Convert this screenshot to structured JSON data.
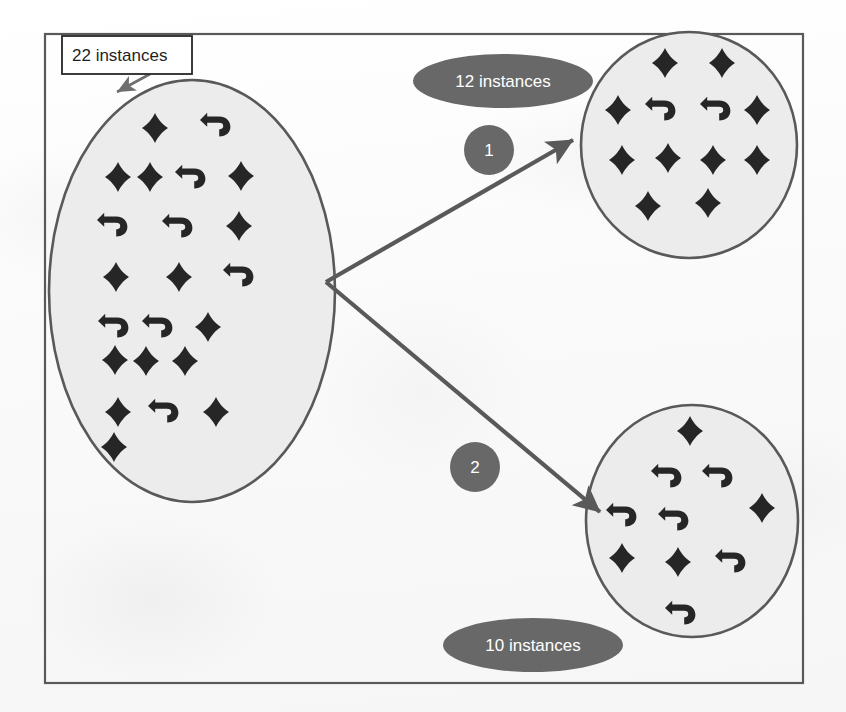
{
  "figure": {
    "kind": "clustering-split-diagram",
    "frame": {
      "x": 45,
      "y": 34,
      "width": 758,
      "height": 649
    },
    "colors": {
      "frame_border": "#595959",
      "ellipse_fill": "#ececec",
      "ellipse_border": "#595959",
      "glyph": "#262626",
      "pill_fill": "#686868",
      "pill_text": "#ffffff",
      "callout_fill": "#ffffff",
      "callout_border": "#262626",
      "callout_text": "#1f1f1f",
      "arrow": "#595959",
      "background": "#fdfdfd"
    },
    "legend": {
      "glyph_types": [
        "diamond",
        "u-turn-arrow"
      ]
    }
  },
  "callout": {
    "label": "22 instances",
    "box": {
      "x": 62,
      "y": 36,
      "width": 130,
      "height": 38
    },
    "pointer": {
      "x1": 150,
      "y1": 74,
      "x2": 117,
      "y2": 92
    }
  },
  "pills": [
    {
      "id": "pill-12",
      "label": "12 instances",
      "cx": 503,
      "cy": 81,
      "rx": 90,
      "ry": 27
    },
    {
      "id": "pill-10",
      "label": "10 instances",
      "cx": 533,
      "cy": 645,
      "rx": 90,
      "ry": 27
    }
  ],
  "edge_badges": [
    {
      "id": "badge-1",
      "label": "1",
      "cx": 489,
      "cy": 150,
      "r": 25
    },
    {
      "id": "badge-2",
      "label": "2",
      "cx": 475,
      "cy": 467,
      "r": 25
    }
  ],
  "arrows": [
    {
      "id": "arrow-branch-1",
      "x1": 326,
      "y1": 282,
      "x2": 573,
      "y2": 140
    },
    {
      "id": "arrow-branch-2",
      "x1": 326,
      "y1": 282,
      "x2": 600,
      "y2": 512
    }
  ],
  "clusters": [
    {
      "id": "cluster-source",
      "name": "source-cluster",
      "count": 22,
      "cx": 192,
      "cy": 291,
      "rx": 143,
      "ry": 211,
      "items": [
        {
          "type": "diamond",
          "x": 155,
          "y": 128
        },
        {
          "type": "arrow",
          "x": 216,
          "y": 126
        },
        {
          "type": "diamond",
          "x": 118,
          "y": 177
        },
        {
          "type": "diamond",
          "x": 150,
          "y": 177
        },
        {
          "type": "arrow",
          "x": 191,
          "y": 178
        },
        {
          "type": "diamond",
          "x": 241,
          "y": 176
        },
        {
          "type": "arrow",
          "x": 113,
          "y": 226
        },
        {
          "type": "arrow",
          "x": 178,
          "y": 227
        },
        {
          "type": "diamond",
          "x": 239,
          "y": 226
        },
        {
          "type": "diamond",
          "x": 116,
          "y": 277
        },
        {
          "type": "diamond",
          "x": 179,
          "y": 277
        },
        {
          "type": "arrow",
          "x": 239,
          "y": 276
        },
        {
          "type": "arrow",
          "x": 114,
          "y": 327
        },
        {
          "type": "arrow",
          "x": 158,
          "y": 327
        },
        {
          "type": "diamond",
          "x": 208,
          "y": 327
        },
        {
          "type": "diamond",
          "x": 115,
          "y": 360
        },
        {
          "type": "diamond",
          "x": 146,
          "y": 361
        },
        {
          "type": "diamond",
          "x": 185,
          "y": 361
        },
        {
          "type": "diamond",
          "x": 118,
          "y": 412
        },
        {
          "type": "arrow",
          "x": 164,
          "y": 412
        },
        {
          "type": "diamond",
          "x": 216,
          "y": 412
        },
        {
          "type": "diamond",
          "x": 114,
          "y": 447
        }
      ]
    },
    {
      "id": "cluster-top-right",
      "name": "cluster-1",
      "count": 12,
      "cx": 689,
      "cy": 145,
      "rx": 108,
      "ry": 113,
      "items": [
        {
          "type": "diamond",
          "x": 665,
          "y": 63
        },
        {
          "type": "diamond",
          "x": 722,
          "y": 63
        },
        {
          "type": "diamond",
          "x": 618,
          "y": 110
        },
        {
          "type": "arrow",
          "x": 661,
          "y": 110
        },
        {
          "type": "arrow",
          "x": 716,
          "y": 110
        },
        {
          "type": "diamond",
          "x": 757,
          "y": 110
        },
        {
          "type": "diamond",
          "x": 622,
          "y": 160
        },
        {
          "type": "diamond",
          "x": 668,
          "y": 158
        },
        {
          "type": "diamond",
          "x": 713,
          "y": 160
        },
        {
          "type": "diamond",
          "x": 757,
          "y": 160
        },
        {
          "type": "diamond",
          "x": 648,
          "y": 206
        },
        {
          "type": "diamond",
          "x": 708,
          "y": 203
        }
      ]
    },
    {
      "id": "cluster-bottom-right",
      "name": "cluster-2",
      "count": 10,
      "cx": 692,
      "cy": 521,
      "rx": 106,
      "ry": 116,
      "items": [
        {
          "type": "diamond",
          "x": 690,
          "y": 431
        },
        {
          "type": "arrow",
          "x": 667,
          "y": 477
        },
        {
          "type": "arrow",
          "x": 718,
          "y": 477
        },
        {
          "type": "arrow",
          "x": 622,
          "y": 516
        },
        {
          "type": "arrow",
          "x": 674,
          "y": 520
        },
        {
          "type": "diamond",
          "x": 762,
          "y": 508
        },
        {
          "type": "diamond",
          "x": 622,
          "y": 558
        },
        {
          "type": "diamond",
          "x": 678,
          "y": 562
        },
        {
          "type": "arrow",
          "x": 731,
          "y": 562
        },
        {
          "type": "arrow",
          "x": 681,
          "y": 614
        }
      ]
    }
  ]
}
